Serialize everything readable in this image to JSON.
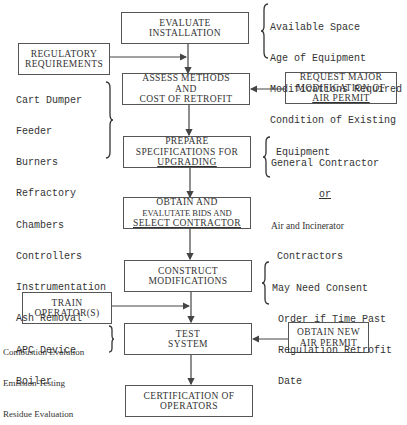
{
  "flowchart": {
    "main_steps": [
      {
        "id": "evaluate",
        "lines": [
          "EVALUATE",
          "INSTALLATION"
        ]
      },
      {
        "id": "assess",
        "lines": [
          "ASSESS METHODS",
          "AND",
          "COST OF RETROFIT"
        ]
      },
      {
        "id": "prepare",
        "lines": [
          "PREPARE",
          "SPECIFICATIONS FOR",
          "UPGRADING"
        ]
      },
      {
        "id": "obtain-bids",
        "lines": [
          "OBTAIN AND",
          "EVALUTATE BIDS AND",
          "SELECT CONTRACTOR"
        ]
      },
      {
        "id": "construct",
        "lines": [
          "CONSTRUCT",
          "MODIFICATIONS"
        ]
      },
      {
        "id": "test",
        "lines": [
          "TEST",
          "SYSTEM"
        ]
      },
      {
        "id": "certification",
        "lines": [
          "CERTIFICATION OF",
          "OPERATORS"
        ]
      }
    ],
    "side_inputs": [
      {
        "id": "regulatory",
        "lines": [
          "REGULATORY",
          "REQUIREMENTS"
        ],
        "feeds": "assess"
      },
      {
        "id": "request-permit",
        "lines": [
          "REQUEST MAJOR",
          "MODIFICATION OF",
          "AIR PERMIT"
        ],
        "feeds": "assess"
      },
      {
        "id": "train",
        "lines": [
          "TRAIN",
          "OPERATOR(S)"
        ],
        "feeds": "test"
      },
      {
        "id": "new-permit",
        "lines": [
          "OBTAIN NEW",
          "AIR PERMIT"
        ],
        "feeds": "test"
      }
    ],
    "annotations": {
      "evaluate": [
        "Available Space",
        "Age of Equipment",
        "Modifications Required",
        "Condition of Existing",
        " Equipment"
      ],
      "assess": [
        "Cart Dumper",
        "Feeder",
        "Burners",
        "Refractory",
        "Chambers",
        "Controllers",
        "Instrumentation",
        "Ash Removal",
        "APC Device",
        "Boiler"
      ],
      "prepare": [
        "General Contractor",
        "or",
        "Air and Incinerator",
        "Contractors"
      ],
      "construct": [
        "May Need Consent",
        "Order if Time Past",
        "Regulation Retrofit",
        "Date"
      ],
      "train": [
        "Combustion Evalution",
        "Emission Testing",
        "Residue Evaluation"
      ]
    }
  }
}
